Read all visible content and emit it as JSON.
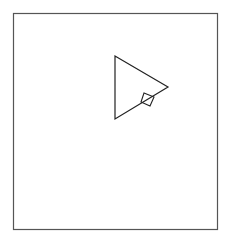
{
  "diagram": {
    "background": "#ffffff",
    "stroke_color": "#333333",
    "frame": {
      "x": 13.5,
      "y": 13.5,
      "width": 204,
      "height": 216,
      "stroke": "#555555",
      "stroke_width": 1.2
    },
    "triangle": {
      "points": "115,56 168,87 115,119",
      "stroke": "#222222",
      "stroke_width": 1.2
    },
    "square": {
      "points": "144,93 154,97 150,106 141,102",
      "stroke": "#222222",
      "stroke_width": 1.1
    }
  }
}
